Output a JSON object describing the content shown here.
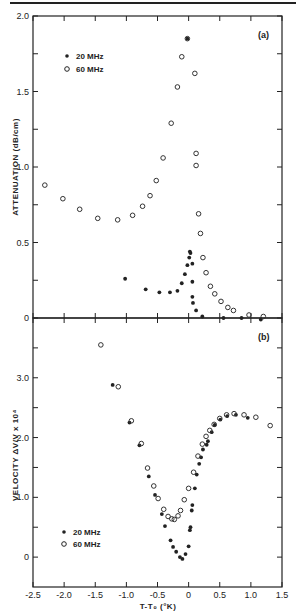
{
  "figure": {
    "panels": [
      {
        "label": "(a)",
        "ylabel": "ATTENUATION (dB/cm)"
      },
      {
        "label": "(b)",
        "ylabel": "VELOCITY ΔV/V x 10⁴"
      }
    ],
    "xlabel": "T-T₀ (°K)",
    "legend": [
      {
        "marker": "filled-circle",
        "label": "20 MHz"
      },
      {
        "marker": "open-circle",
        "label": "60 MHz"
      }
    ]
  },
  "chart_data": [
    {
      "type": "scatter",
      "title": "",
      "panel_label": "(a)",
      "xlabel": "T-T₀ (°K)",
      "ylabel": "ATTENUATION (dB/cm)",
      "xlim": [
        -2.5,
        1.5
      ],
      "ylim": [
        0,
        2.0
      ],
      "x_ticks": [
        -2.5,
        -2.0,
        -1.5,
        -1.0,
        -0.5,
        0,
        0.5,
        1.0,
        1.5
      ],
      "y_ticks": [
        0,
        0.5,
        1.0,
        1.5,
        2.0
      ],
      "y_tick_labels": [
        "0",
        "0.5",
        "1.0",
        "1.5",
        "2.0"
      ],
      "grid": false,
      "legend_position": "upper-left",
      "series": [
        {
          "name": "20 MHz",
          "marker": "filled",
          "points": [
            [
              -1.02,
              0.26
            ],
            [
              -0.69,
              0.19
            ],
            [
              -0.47,
              0.17
            ],
            [
              -0.3,
              0.17
            ],
            [
              -0.18,
              0.18
            ],
            [
              -0.11,
              0.23
            ],
            [
              -0.06,
              0.29
            ],
            [
              -0.02,
              0.35
            ],
            [
              0.01,
              0.4
            ],
            [
              0.03,
              0.43
            ],
            [
              0.02,
              0.44
            ],
            [
              -0.02,
              1.85
            ],
            [
              0.06,
              0.36
            ],
            [
              0.06,
              0.24
            ],
            [
              0.06,
              0.14
            ],
            [
              0.07,
              0.1
            ],
            [
              0.12,
              0.05
            ],
            [
              0.22,
              0.01
            ],
            [
              0.56,
              0.0
            ],
            [
              0.85,
              0.0
            ],
            [
              1.16,
              -0.01
            ]
          ]
        },
        {
          "name": "60 MHz",
          "marker": "open",
          "points": [
            [
              -2.31,
              0.88
            ],
            [
              -2.02,
              0.79
            ],
            [
              -1.75,
              0.72
            ],
            [
              -1.46,
              0.66
            ],
            [
              -1.14,
              0.65
            ],
            [
              -0.9,
              0.68
            ],
            [
              -0.74,
              0.74
            ],
            [
              -0.62,
              0.81
            ],
            [
              -0.52,
              0.91
            ],
            [
              -0.41,
              1.06
            ],
            [
              -0.28,
              1.29
            ],
            [
              -0.18,
              1.53
            ],
            [
              -0.11,
              1.73
            ],
            [
              -0.02,
              1.85
            ],
            [
              0.1,
              1.62
            ],
            [
              0.12,
              1.09
            ],
            [
              0.12,
              1.01
            ],
            [
              0.16,
              0.69
            ],
            [
              0.19,
              0.56
            ],
            [
              0.23,
              0.4
            ],
            [
              0.28,
              0.3
            ],
            [
              0.35,
              0.21
            ],
            [
              0.42,
              0.16
            ],
            [
              0.52,
              0.11
            ],
            [
              0.63,
              0.07
            ],
            [
              0.72,
              0.05
            ],
            [
              0.97,
              0.02
            ],
            [
              1.2,
              0.01
            ]
          ]
        }
      ]
    },
    {
      "type": "scatter",
      "title": "",
      "panel_label": "(b)",
      "xlabel": "T-T₀ (°K)",
      "ylabel": "VELOCITY ΔV/V x 10⁴",
      "xlim": [
        -2.5,
        1.5
      ],
      "ylim": [
        -0.5,
        4.0
      ],
      "x_ticks": [
        -2.5,
        -2.0,
        -1.5,
        -1.0,
        -0.5,
        0,
        0.5,
        1.0,
        1.5
      ],
      "x_tick_labels": [
        "-2.5",
        "-2.0",
        "-1.5",
        "-1.0",
        "-0.5",
        "0",
        "0.5",
        "1.0",
        "1.5"
      ],
      "y_ticks": [
        0,
        1.0,
        2.0,
        3.0
      ],
      "y_tick_labels": [
        "0",
        "1.0",
        "2.0",
        "3.0"
      ],
      "grid": false,
      "legend_position": "lower-left",
      "series": [
        {
          "name": "20 MHz",
          "marker": "filled",
          "points": [
            [
              -1.22,
              2.88
            ],
            [
              -0.95,
              2.25
            ],
            [
              -0.79,
              1.87
            ],
            [
              -0.64,
              1.35
            ],
            [
              -0.54,
              1.04
            ],
            [
              -0.43,
              0.72
            ],
            [
              -0.38,
              0.52
            ],
            [
              -0.29,
              0.28
            ],
            [
              -0.25,
              0.17
            ],
            [
              -0.2,
              0.09
            ],
            [
              -0.14,
              0.0
            ],
            [
              -0.1,
              -0.03
            ],
            [
              -0.05,
              0.05
            ],
            [
              0.0,
              0.18
            ],
            [
              0.02,
              0.45
            ],
            [
              0.03,
              0.5
            ],
            [
              0.05,
              0.78
            ],
            [
              0.06,
              0.87
            ],
            [
              0.1,
              1.15
            ],
            [
              0.13,
              1.38
            ],
            [
              0.17,
              1.56
            ],
            [
              0.2,
              1.67
            ],
            [
              0.23,
              1.8
            ],
            [
              0.29,
              1.88
            ],
            [
              0.31,
              1.94
            ],
            [
              0.37,
              2.09
            ],
            [
              0.42,
              2.21
            ],
            [
              0.51,
              2.3
            ],
            [
              0.62,
              2.36
            ],
            [
              0.76,
              2.38
            ],
            [
              0.95,
              2.33
            ]
          ]
        },
        {
          "name": "60 MHz",
          "marker": "open",
          "points": [
            [
              -1.41,
              3.55
            ],
            [
              -1.13,
              2.85
            ],
            [
              -0.92,
              2.28
            ],
            [
              -0.76,
              1.9
            ],
            [
              -0.66,
              1.49
            ],
            [
              -0.56,
              1.19
            ],
            [
              -0.49,
              0.98
            ],
            [
              -0.4,
              0.8
            ],
            [
              -0.33,
              0.68
            ],
            [
              -0.27,
              0.64
            ],
            [
              -0.23,
              0.63
            ],
            [
              -0.17,
              0.69
            ],
            [
              -0.13,
              0.78
            ],
            [
              -0.07,
              0.96
            ],
            [
              0.0,
              1.15
            ],
            [
              0.08,
              1.42
            ],
            [
              0.15,
              1.69
            ],
            [
              0.22,
              1.89
            ],
            [
              0.28,
              2.02
            ],
            [
              0.34,
              2.12
            ],
            [
              0.41,
              2.22
            ],
            [
              0.5,
              2.32
            ],
            [
              0.61,
              2.38
            ],
            [
              0.73,
              2.4
            ],
            [
              0.89,
              2.38
            ],
            [
              1.08,
              2.34
            ],
            [
              1.31,
              2.2
            ]
          ]
        }
      ]
    }
  ]
}
